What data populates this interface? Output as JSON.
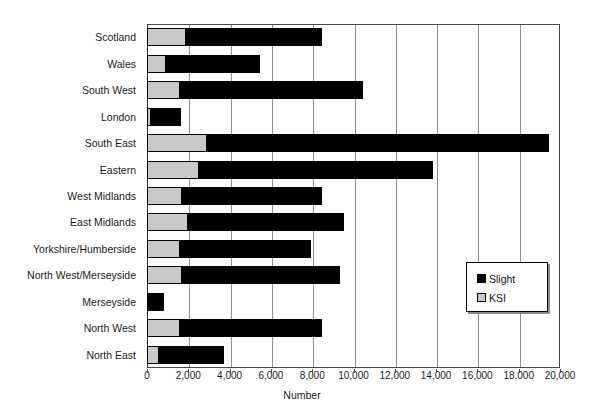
{
  "chart_data": {
    "type": "bar",
    "orientation": "horizontal",
    "stacked": true,
    "title": "",
    "xlabel": "Number",
    "ylabel": "",
    "xlim": [
      0,
      20000
    ],
    "xticks": [
      0,
      2000,
      4000,
      6000,
      8000,
      10000,
      12000,
      14000,
      16000,
      18000,
      20000
    ],
    "xtick_labels": [
      "0",
      "2,000",
      "4,000",
      "6,000",
      "8,000",
      "10,000",
      "12,000",
      "14,000",
      "16,000",
      "18,000",
      "20,000"
    ],
    "grid": true,
    "legend_position": "right-inside",
    "categories": [
      "Scotland",
      "Wales",
      "South West",
      "London",
      "South East",
      "Eastern",
      "West Midlands",
      "East Midlands",
      "Yorkshire/Humberside",
      "North West/Merseyside",
      "Merseyside",
      "North West",
      "North East"
    ],
    "series": [
      {
        "name": "KSI",
        "color": "#c9c9c9",
        "values": [
          1900,
          900,
          1600,
          200,
          2900,
          2500,
          1700,
          2000,
          1600,
          1700,
          0,
          1600,
          600
        ]
      },
      {
        "name": "Slight",
        "color": "#000000",
        "values": [
          6600,
          4600,
          8900,
          1500,
          16600,
          11400,
          6800,
          7600,
          6400,
          7700,
          800,
          6900,
          3200
        ]
      }
    ],
    "totals": [
      8500,
      5500,
      10500,
      1700,
      19500,
      13900,
      8500,
      9600,
      8000,
      9400,
      800,
      8500,
      3800
    ]
  },
  "legend": {
    "items": [
      {
        "label": "Slight",
        "swatch": "black-square-icon"
      },
      {
        "label": "KSI",
        "swatch": "gray-square-icon"
      }
    ]
  }
}
